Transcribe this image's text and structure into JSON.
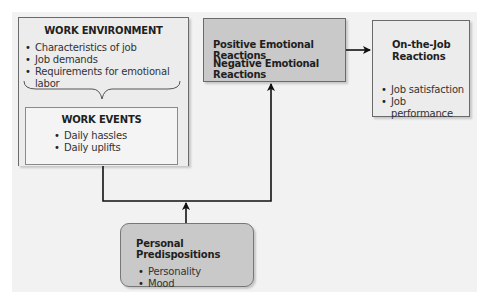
{
  "diagram": {
    "work_environment": {
      "title": "WORK ENVIRONMENT",
      "items": [
        "Characteristics of job",
        "Job demands",
        "Requirements for emotional labor"
      ]
    },
    "work_events": {
      "title": "WORK EVENTS",
      "items": [
        "Daily hassles",
        "Daily uplifts"
      ]
    },
    "emotional_reactions": {
      "line1": "Positive Emotional Reactions",
      "line2": "Negative Emotional Reactions"
    },
    "on_the_job": {
      "title_line1": "On-the-Job",
      "title_line2": "Reactions",
      "items": [
        "Job satisfaction",
        "Job performance"
      ]
    },
    "personal_predispositions": {
      "title": "Personal Predispositions",
      "items": [
        "Personality",
        "Mood"
      ]
    }
  },
  "colors": {
    "panel_bg": "#f2f2f2",
    "highlight_box": "#c9c9c9",
    "light_box": "#ececec",
    "line": "#111111"
  }
}
